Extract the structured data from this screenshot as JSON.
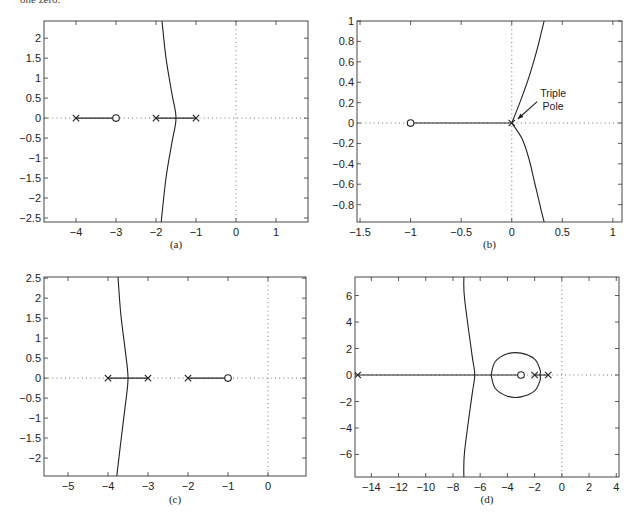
{
  "page": {
    "top_text_fragment": "one zero."
  },
  "chart_data": [
    {
      "id": "a",
      "type": "line",
      "title": "",
      "caption": "(a)",
      "plot_kind": "root locus",
      "xlabel": "",
      "ylabel": "",
      "xlim": [
        -4.8,
        1.8
      ],
      "ylim": [
        -2.6,
        2.43
      ],
      "x_ticks": [
        -4,
        -3,
        -2,
        -1,
        0,
        1
      ],
      "x_tick_labels": [
        "−4",
        "−3",
        "−2",
        "−1",
        "0",
        "1"
      ],
      "y_ticks": [
        2,
        1.5,
        1,
        0.5,
        0,
        -0.5,
        -1,
        -1.5,
        -2,
        -2.5
      ],
      "y_tick_labels": [
        "2",
        "1.5",
        "1",
        "0.5",
        "0",
        "−0.5",
        "−1",
        "−1.5",
        "−2",
        "−2.5"
      ],
      "grid": false,
      "poles": [
        [
          -4,
          0
        ],
        [
          -2,
          0
        ],
        [
          -1,
          0
        ]
      ],
      "zeros": [
        [
          -3,
          0
        ]
      ],
      "real_axis_segments": [
        [
          -4,
          -3
        ],
        [
          -2,
          -1
        ]
      ],
      "branches": [
        {
          "name": "asymptotic branch",
          "points": [
            [
              -1.85,
              2.43
            ],
            [
              -1.75,
              1.5
            ],
            [
              -1.6,
              0.6
            ],
            [
              -1.5,
              0
            ],
            [
              -1.6,
              -0.6
            ],
            [
              -1.75,
              -1.5
            ],
            [
              -1.87,
              -2.6
            ]
          ]
        }
      ],
      "annotations": []
    },
    {
      "id": "b",
      "type": "line",
      "title": "",
      "caption": "(b)",
      "plot_kind": "root locus",
      "xlabel": "",
      "ylabel": "",
      "xlim": [
        -1.53,
        1.09
      ],
      "ylim": [
        -0.97,
        1.0
      ],
      "x_ticks": [
        -1.5,
        -1,
        -0.5,
        0,
        0.5,
        1
      ],
      "x_tick_labels": [
        "−1.5",
        "−1",
        "−0.5",
        "0",
        "0.5",
        "1"
      ],
      "y_ticks": [
        1,
        0.8,
        0.6,
        0.4,
        0.2,
        0,
        -0.2,
        -0.4,
        -0.6,
        -0.8
      ],
      "y_tick_labels": [
        "1",
        "0.8",
        "0.6",
        "0.4",
        "0.2",
        "0",
        "−0.2",
        "−0.4",
        "−0.6",
        "−0.8"
      ],
      "grid": false,
      "poles": [
        [
          0,
          0
        ],
        [
          0,
          0
        ],
        [
          0,
          0
        ]
      ],
      "zeros": [
        [
          -1,
          0
        ]
      ],
      "real_axis_segments": [
        [
          -1,
          0
        ]
      ],
      "branches": [
        {
          "name": "upper branch",
          "points": [
            [
              0,
              0
            ],
            [
              0.08,
              0.2
            ],
            [
              0.17,
              0.45
            ],
            [
              0.25,
              0.72
            ],
            [
              0.3,
              0.92
            ],
            [
              0.32,
              1.0
            ]
          ]
        },
        {
          "name": "lower branch",
          "points": [
            [
              0,
              0
            ],
            [
              0.1,
              -0.15
            ],
            [
              0.17,
              -0.35
            ],
            [
              0.23,
              -0.6
            ],
            [
              0.29,
              -0.85
            ],
            [
              0.32,
              -0.97
            ]
          ]
        }
      ],
      "annotations": [
        {
          "text_line1": "Triple",
          "text_line2": "Pole",
          "text_xy": [
            0.33,
            0.22
          ],
          "arrow_to": [
            0.03,
            0.02
          ]
        }
      ]
    },
    {
      "id": "c",
      "type": "line",
      "title": "",
      "caption": "(c)",
      "plot_kind": "root locus",
      "xlabel": "",
      "ylabel": "",
      "xlim": [
        -5.6,
        0.95
      ],
      "ylim": [
        -2.45,
        2.53
      ],
      "x_ticks": [
        -5,
        -4,
        -3,
        -2,
        -1,
        0
      ],
      "x_tick_labels": [
        "−5",
        "−4",
        "−3",
        "−2",
        "−1",
        "0"
      ],
      "y_ticks": [
        2.5,
        2,
        1.5,
        1,
        0.5,
        0,
        -0.5,
        -1,
        -1.5,
        -2
      ],
      "y_tick_labels": [
        "2.5",
        "2",
        "1.5",
        "1",
        "0.5",
        "0",
        "−0.5",
        "−1",
        "−1.5",
        "−2"
      ],
      "grid": false,
      "poles": [
        [
          -4,
          0
        ],
        [
          -3,
          0
        ],
        [
          -2,
          0
        ]
      ],
      "zeros": [
        [
          -1,
          0
        ]
      ],
      "real_axis_segments": [
        [
          -4,
          -3
        ],
        [
          -2,
          -1
        ]
      ],
      "branches": [
        {
          "name": "asymptotic branch",
          "points": [
            [
              -3.75,
              2.53
            ],
            [
              -3.68,
              1.6
            ],
            [
              -3.57,
              0.7
            ],
            [
              -3.5,
              0
            ],
            [
              -3.57,
              -0.7
            ],
            [
              -3.68,
              -1.6
            ],
            [
              -3.78,
              -2.45
            ]
          ]
        }
      ],
      "annotations": []
    },
    {
      "id": "d",
      "type": "line",
      "title": "",
      "caption": "(d)",
      "plot_kind": "root locus",
      "xlabel": "",
      "ylabel": "",
      "xlim": [
        -15.2,
        4.2
      ],
      "ylim": [
        -7.7,
        7.4
      ],
      "x_ticks": [
        -14,
        -12,
        -10,
        -8,
        -6,
        -4,
        -2,
        0,
        2,
        4
      ],
      "x_tick_labels": [
        "−14",
        "−12",
        "−10",
        "−8",
        "−6",
        "−4",
        "−2",
        "0",
        "2",
        "4"
      ],
      "y_ticks": [
        6,
        4,
        2,
        0,
        -2,
        -4,
        -6
      ],
      "y_tick_labels": [
        "6",
        "4",
        "2",
        "0",
        "−2",
        "−4",
        "−6"
      ],
      "grid": false,
      "poles": [
        [
          -15,
          0
        ],
        [
          -2,
          0
        ],
        [
          -1,
          0
        ]
      ],
      "zeros": [
        [
          -3,
          0
        ]
      ],
      "real_axis_segments": [
        [
          -15,
          -3
        ],
        [
          -2,
          -1
        ]
      ],
      "branches": [
        {
          "name": "asymptotic branch",
          "points": [
            [
              -7.2,
              7.4
            ],
            [
              -7.15,
              5.8
            ],
            [
              -6.6,
              1.5
            ],
            [
              -6.4,
              0
            ],
            [
              -6.6,
              -1.5
            ],
            [
              -7.15,
              -5.8
            ],
            [
              -7.2,
              -7.7
            ]
          ]
        },
        {
          "name": "closed loop around zero",
          "points": [
            [
              -5.2,
              0
            ],
            [
              -4.9,
              1.0
            ],
            [
              -4.0,
              1.6
            ],
            [
              -3.0,
              1.65
            ],
            [
              -2.0,
              1.2
            ],
            [
              -1.6,
              0.4
            ],
            [
              -1.6,
              0
            ],
            [
              -1.6,
              -0.4
            ],
            [
              -2.0,
              -1.2
            ],
            [
              -3.0,
              -1.65
            ],
            [
              -4.0,
              -1.6
            ],
            [
              -4.9,
              -1.0
            ],
            [
              -5.2,
              0
            ]
          ]
        }
      ],
      "annotations": []
    }
  ]
}
